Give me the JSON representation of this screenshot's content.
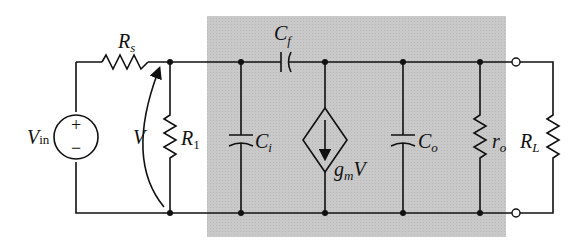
{
  "diagram": {
    "type": "circuit-schematic",
    "shaded_region_color": "#c8c8c8",
    "wire_color": "#111111",
    "components": {
      "source": {
        "label": "V",
        "sub": "in",
        "plus": "+",
        "minus": "−"
      },
      "rs": {
        "label": "R",
        "sub": "s"
      },
      "v_arrow": {
        "label": "V"
      },
      "r1": {
        "label": "R",
        "sub": "1"
      },
      "cf": {
        "label": "C",
        "sub": "f"
      },
      "ci": {
        "label": "C",
        "sub": "i"
      },
      "gm": {
        "label": "g",
        "sub": "m",
        "suffix": "V"
      },
      "co": {
        "label": "C",
        "sub": "o"
      },
      "ro": {
        "label": "r",
        "sub": "o"
      },
      "rl": {
        "label": "R",
        "sub": "L"
      }
    }
  }
}
